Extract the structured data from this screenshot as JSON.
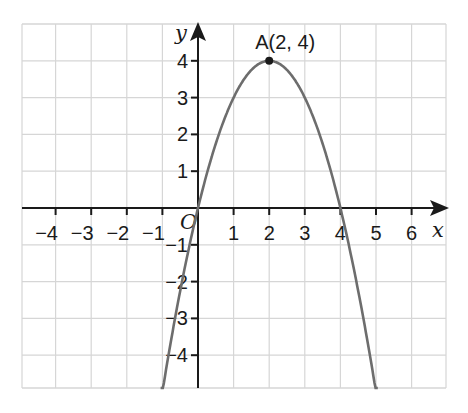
{
  "chart_data": {
    "type": "line",
    "title": "",
    "xlabel": "x",
    "ylabel": "y",
    "origin_label": "O",
    "xlim": [
      -5,
      7
    ],
    "ylim": [
      -5,
      5
    ],
    "x_ticks": [
      -4,
      -3,
      -2,
      -1,
      1,
      2,
      3,
      4,
      5,
      6
    ],
    "x_tick_labels": [
      "−4",
      "−3",
      "−2",
      "−1",
      "1",
      "2",
      "3",
      "4",
      "5",
      "6"
    ],
    "y_ticks": [
      4,
      3,
      2,
      1,
      -1,
      -2,
      -3,
      -4
    ],
    "y_tick_labels": [
      "4",
      "3",
      "2",
      "1",
      "−1",
      "−2",
      "−3",
      "−4"
    ],
    "grid": true,
    "series": [
      {
        "name": "y = -x^2 + 4x",
        "color": "#6d6d6d",
        "x": [
          -1.05,
          -0.5,
          0,
          0.5,
          1,
          1.5,
          2,
          2.5,
          3,
          3.5,
          4,
          4.5,
          5.05
        ],
        "y": [
          -5.2,
          -2.25,
          0,
          1.75,
          3,
          3.75,
          4,
          3.75,
          3,
          1.75,
          0,
          -2.25,
          -5.2
        ]
      }
    ],
    "annotations": [
      {
        "label": "A(2, 4)",
        "x": 2,
        "y": 4,
        "marker": "point"
      }
    ]
  }
}
